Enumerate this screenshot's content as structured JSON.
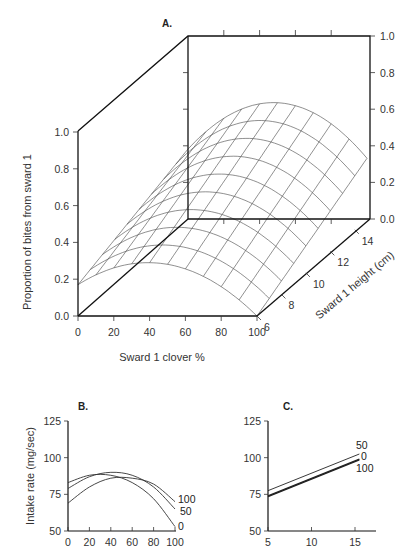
{
  "chart_data": [
    {
      "panel": "A.",
      "type": "surface3d",
      "title": "A.",
      "xlabel": "Sward 1 clover %",
      "ylabel": "Sward 1 height (cm)",
      "zlabel": "Proportion of bites from sward 1",
      "x_ticks": [
        "0",
        "20",
        "40",
        "60",
        "80",
        "100"
      ],
      "y_ticks": [
        "6",
        "8",
        "10",
        "12",
        "14"
      ],
      "z_ticks": [
        "0.0",
        "0.2",
        "0.4",
        "0.6",
        "0.8",
        "1.0"
      ],
      "xlim": [
        0,
        100
      ],
      "ylim": [
        6,
        15
      ],
      "zlim": [
        0,
        1
      ],
      "surface_edges": {
        "height_6": {
          "x": [
            0,
            20,
            40,
            60,
            80,
            100
          ],
          "z": [
            0.17,
            0.26,
            0.29,
            0.26,
            0.16,
            0.0
          ]
        },
        "height_15": {
          "x": [
            0,
            20,
            40,
            60,
            80,
            100
          ],
          "z": [
            0.38,
            0.55,
            0.63,
            0.62,
            0.52,
            0.33
          ]
        }
      }
    },
    {
      "panel": "B.",
      "type": "line",
      "title": "B.",
      "xlabel": "",
      "ylabel": "Intake rate (mg/sec)",
      "x_ticks": [
        "0",
        "20",
        "40",
        "60",
        "80",
        "100"
      ],
      "y_ticks": [
        "50",
        "75",
        "100",
        "125"
      ],
      "xlim": [
        0,
        100
      ],
      "ylim": [
        50,
        125
      ],
      "x": [
        0,
        20,
        40,
        60,
        80,
        100
      ],
      "series": [
        {
          "name": "0",
          "values": [
            83,
            88,
            88,
            83,
            72,
            53
          ]
        },
        {
          "name": "50",
          "values": [
            79,
            87,
            90,
            88,
            80,
            65
          ]
        },
        {
          "name": "100",
          "values": [
            69,
            80,
            86,
            86,
            82,
            70
          ]
        }
      ]
    },
    {
      "panel": "C.",
      "type": "line",
      "title": "C.",
      "xlabel": "",
      "ylabel": "",
      "x_ticks": [
        "5",
        "10",
        "15"
      ],
      "y_ticks": [
        "50",
        "75",
        "100",
        "125"
      ],
      "xlim": [
        5,
        17
      ],
      "ylim": [
        50,
        125
      ],
      "x": [
        5,
        15.5
      ],
      "series": [
        {
          "name": "50",
          "values": [
            77.5,
            102.5
          ]
        },
        {
          "name": "0",
          "values": [
            74,
            99
          ]
        },
        {
          "name": "100",
          "values": [
            73.5,
            98.5
          ]
        }
      ]
    }
  ],
  "panelA": {
    "label": "A.",
    "z_title": "Proportion of bites from sward 1",
    "x_title": "Sward 1 clover %",
    "y_title": "Sward 1 height (cm)",
    "z_ticks": [
      "0.0",
      "0.2",
      "0.4",
      "0.6",
      "0.8",
      "1.0"
    ],
    "x_ticks": [
      "0",
      "20",
      "40",
      "60",
      "80",
      "100"
    ],
    "y_ticks": [
      "6",
      "8",
      "10",
      "12",
      "14"
    ]
  },
  "panelB": {
    "label": "B.",
    "y_title": "Intake rate (mg/sec)",
    "y_ticks": [
      "50",
      "75",
      "100",
      "125"
    ],
    "x_ticks": [
      "0",
      "20",
      "40",
      "60",
      "80",
      "100"
    ],
    "series_labels": [
      "100",
      "50",
      "0"
    ]
  },
  "panelC": {
    "label": "C.",
    "y_ticks": [
      "50",
      "75",
      "100",
      "125"
    ],
    "x_ticks": [
      "5",
      "10",
      "15"
    ],
    "series_labels": [
      "50",
      "0",
      "100"
    ]
  }
}
